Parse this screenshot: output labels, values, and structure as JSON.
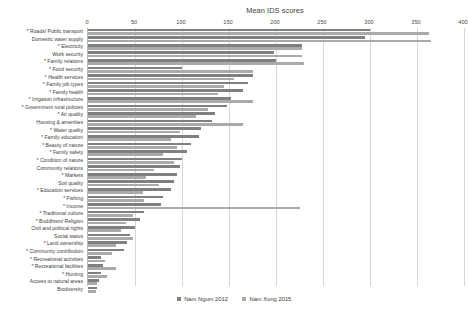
{
  "chart_data": {
    "type": "bar",
    "orientation": "horizontal",
    "title": "Mean IDS scores",
    "xlabel": "",
    "ylabel": "",
    "xlim": [
      0,
      400
    ],
    "xticks": [
      0,
      50,
      100,
      150,
      200,
      250,
      300,
      350,
      400
    ],
    "grid": true,
    "legend_position": "bottom",
    "categories": [
      "* Roads/ Public transport",
      "Domestic water supply",
      "* Electricity",
      "Work  security",
      "* Family relations",
      "* Food security",
      "* Health services",
      "* Family job types",
      "* Family health",
      "* Irrigation infrastructure",
      "* Government rural policies",
      "* Air quality",
      "Housing & amenities",
      "* Water quality",
      "* Family education",
      "* Beauty of nature",
      "* Family safety",
      "* Condition of nature",
      "Community relations",
      "* Markets",
      "Soil quality",
      "* Education services",
      "* Fishing",
      "* Income",
      "* Traditional culture",
      "* Buddhism/ Religion",
      "Civil and political rights",
      "Social status",
      "* Land ownership",
      "* Community contribution",
      "* Recreational activities",
      "* Recreational facilities",
      "* Hunting",
      "Access to natural areas",
      "Biodiversity"
    ],
    "series": [
      {
        "name": "Nam Ngum 2012",
        "color": "#808080",
        "values": [
          300,
          295,
          228,
          198,
          200,
          100,
          175,
          170,
          165,
          152,
          148,
          135,
          132,
          120,
          118,
          110,
          105,
          100,
          98,
          95,
          92,
          88,
          80,
          78,
          60,
          55,
          50,
          45,
          42,
          38,
          14,
          16,
          14,
          12,
          10
        ]
      },
      {
        "name": "Nam Xong 2015",
        "color": "#aaaaaa",
        "values": [
          363,
          365,
          228,
          228,
          230,
          175,
          155,
          145,
          138,
          175,
          128,
          115,
          165,
          98,
          88,
          95,
          80,
          92,
          70,
          62,
          75,
          58,
          60,
          225,
          48,
          40,
          35,
          48,
          30,
          26,
          18,
          30,
          20,
          10,
          9
        ]
      }
    ]
  },
  "legend": {
    "items": [
      {
        "label": "Nam Ngum 2012",
        "color": "#808080"
      },
      {
        "label": "Nam Xong 2015",
        "color": "#aaaaaa"
      }
    ]
  }
}
